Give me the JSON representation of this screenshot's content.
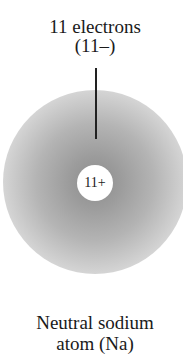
{
  "diagram": {
    "electron_label": {
      "line1": "11 electrons",
      "line2": "(11–)"
    },
    "nucleus_label": "11+",
    "atom_caption": {
      "line1": "Neutral sodium",
      "line2": "atom (Na)"
    },
    "colors": {
      "cloud_center": "#8c8c8c",
      "cloud_edge": "#efefef",
      "nucleus": "#ffffff",
      "text": "#1a1a1a"
    }
  }
}
